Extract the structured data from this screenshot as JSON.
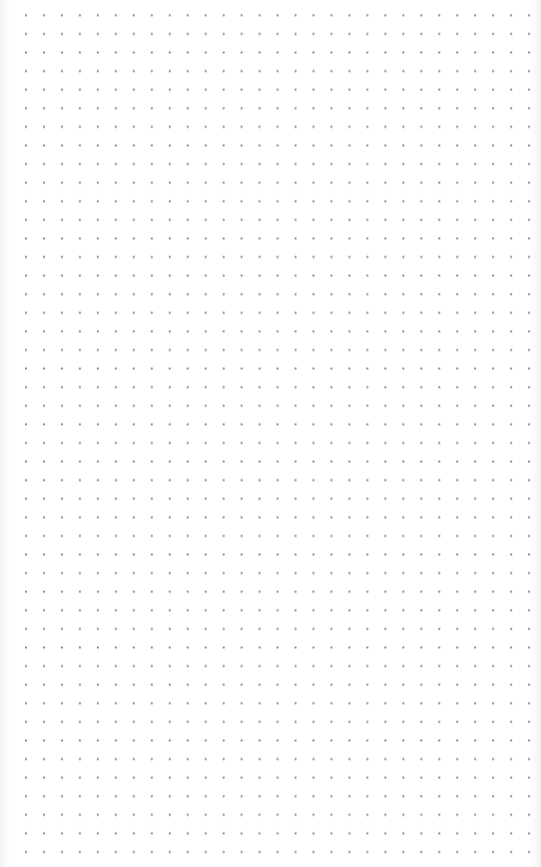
{
  "canvas": {
    "type": "dot-grid",
    "background_color": "#ffffff",
    "dot_color": "#8a8a8a",
    "columns": 29,
    "rows": 46,
    "spacing_x": 17.97,
    "spacing_y": 18.6
  }
}
